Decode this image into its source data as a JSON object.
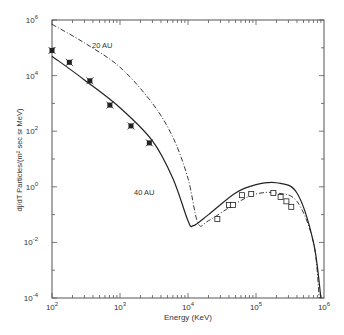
{
  "chart_data": {
    "type": "line",
    "title": "",
    "xlabel": "Energy (KeV)",
    "ylabel": "dj/dT  Particles/(m² sec sr MeV)",
    "xscale": "log",
    "yscale": "log",
    "xlim": [
      100,
      1000000
    ],
    "ylim": [
      0.0001,
      1000000
    ],
    "x_ticks": [
      "10^2",
      "10^3",
      "10^4",
      "10^5",
      "10^6"
    ],
    "y_ticks": [
      "10^6",
      "10^4",
      "10^2",
      "10^0",
      "10^-2",
      "10^-4"
    ],
    "grid": false,
    "annotations": [
      {
        "text": "20 AU",
        "x": 500,
        "y": 60000
      },
      {
        "text": "40 AU",
        "x": 2500,
        "y": 3
      }
    ],
    "series": [
      {
        "name": "40 AU model",
        "style": "solid",
        "x": [
          100,
          300,
          1000,
          3000,
          6000,
          10000,
          12000,
          20000,
          50000,
          100000,
          200000,
          400000,
          700000,
          900000
        ],
        "y": [
          50000,
          7000,
          700,
          45,
          2,
          0.06,
          0.04,
          0.1,
          0.6,
          1.2,
          1.4,
          0.6,
          0.01,
          0.0001
        ]
      },
      {
        "name": "20 AU model",
        "style": "dash-dot",
        "x": [
          100,
          300,
          1000,
          3000,
          6000,
          10000,
          14000,
          20000,
          50000,
          100000,
          200000,
          400000,
          700000,
          850000
        ],
        "y": [
          700000,
          150000,
          20000,
          1000,
          60,
          2,
          0.05,
          0.06,
          0.25,
          0.55,
          0.6,
          0.3,
          0.01,
          0.0001
        ]
      },
      {
        "name": "data (stars)",
        "style": "marker-star",
        "x": [
          100,
          180,
          360,
          710,
          1450,
          2700
        ],
        "y": [
          80000,
          30000,
          6500,
          870,
          155,
          38
        ]
      },
      {
        "name": "data (squares)",
        "style": "marker-square",
        "x": [
          27000,
          40000,
          46000,
          62000,
          85000,
          180000,
          230000,
          280000,
          330000
        ],
        "y": [
          0.07,
          0.22,
          0.22,
          0.5,
          0.55,
          0.6,
          0.43,
          0.3,
          0.19
        ]
      }
    ]
  },
  "labels": {
    "xlabel": "Energy (KeV)",
    "ylabel": "dj/dT  Particles/(m² sec sr MeV)",
    "annot_20": "20 AU",
    "annot_40": "40 AU"
  },
  "ticks": {
    "x": [
      {
        "b": "10",
        "e": "2"
      },
      {
        "b": "10",
        "e": "3"
      },
      {
        "b": "10",
        "e": "4"
      },
      {
        "b": "10",
        "e": "5"
      },
      {
        "b": "10",
        "e": "6"
      }
    ],
    "y": [
      {
        "b": "10",
        "e": "6"
      },
      {
        "b": "10",
        "e": "4"
      },
      {
        "b": "10",
        "e": "2"
      },
      {
        "b": "10",
        "e": "0"
      },
      {
        "b": "10",
        "e": "-2"
      },
      {
        "b": "10",
        "e": "-4"
      }
    ]
  }
}
